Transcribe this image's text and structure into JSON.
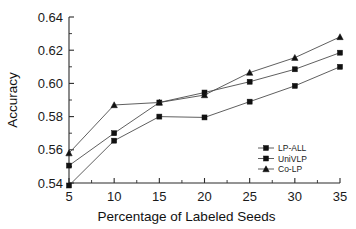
{
  "chart_data": {
    "type": "line",
    "title": "",
    "xlabel": "Percentage of  Labeled Seeds",
    "ylabel": "Accuracy",
    "x": [
      5,
      10,
      15,
      20,
      25,
      30,
      35
    ],
    "xlim": [
      5,
      35
    ],
    "ylim": [
      0.535,
      0.645
    ],
    "xticks": [
      "5",
      "10",
      "15",
      "20",
      "25",
      "30",
      "35"
    ],
    "yticks": [
      "0.54",
      "0.56",
      "0.58",
      "0.60",
      "0.62",
      "0.64"
    ],
    "ytick_values": [
      0.54,
      0.56,
      0.58,
      0.6,
      0.62,
      0.64
    ],
    "grid": false,
    "legend_position": "inside-lower-right",
    "series": [
      {
        "name": "LP-ALL",
        "marker": "square",
        "values": [
          0.5385,
          0.5655,
          0.58,
          0.5795,
          0.589,
          0.5985,
          0.61
        ]
      },
      {
        "name": "UniVLP",
        "marker": "square",
        "values": [
          0.5505,
          0.57,
          0.5885,
          0.5945,
          0.601,
          0.6085,
          0.6185
        ]
      },
      {
        "name": "Co-LP",
        "marker": "triangle",
        "values": [
          0.558,
          0.587,
          0.5885,
          0.593,
          0.6065,
          0.6155,
          0.628
        ]
      }
    ]
  },
  "legend": {
    "items": [
      {
        "label": "LP-ALL"
      },
      {
        "label": "UniVLP"
      },
      {
        "label": "Co-LP"
      }
    ]
  },
  "axes": {
    "x_title": "Percentage of  Labeled Seeds",
    "y_title": "Accuracy"
  }
}
